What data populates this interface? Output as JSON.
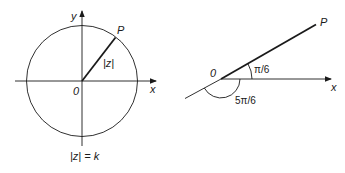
{
  "figure_left": {
    "title": "Circle |z| = k in the Argand plane",
    "labels": {
      "y_axis": "y",
      "x_axis": "x",
      "origin": "0",
      "point": "P",
      "modulus": "|z|",
      "caption": "|z| = k"
    },
    "geometry": {
      "center": [
        82,
        81
      ],
      "radius": 56,
      "point_P": [
        115,
        36
      ]
    }
  },
  "figure_right": {
    "title": "Argument angles of a ray from origin",
    "labels": {
      "origin": "0",
      "point": "P",
      "x_axis": "x",
      "angle_small": "π/6",
      "angle_large": "5π/6"
    },
    "geometry": {
      "origin": [
        221,
        79
      ],
      "point_P": [
        316,
        25
      ]
    }
  },
  "colors": {
    "stroke": "#1a1a1a",
    "background": "#ffffff"
  }
}
